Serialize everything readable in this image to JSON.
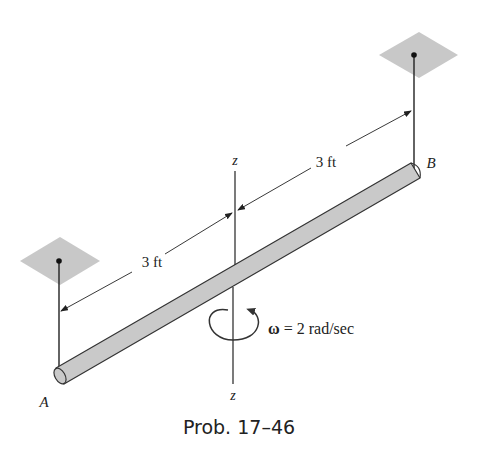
{
  "figure": {
    "caption": "Prob. 17–46",
    "dim_upper": "3 ft",
    "dim_lower": "3 ft",
    "axis_top": "z",
    "axis_bottom": "z",
    "point_a": "A",
    "point_b": "B",
    "omega_symbol": "ω",
    "omega_value": " = 2 rad/sec",
    "colors": {
      "rod_fill": "#c9c9c9",
      "plate_fill": "#c8c8c8",
      "line": "#222222"
    }
  }
}
